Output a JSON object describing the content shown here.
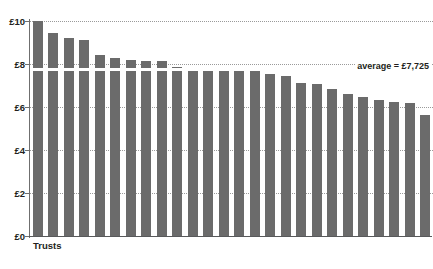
{
  "chart_data": {
    "type": "bar",
    "title": "",
    "xlabel": "Trusts",
    "ylabel": "",
    "ylim": [
      0,
      10
    ],
    "grid": true,
    "legend_position": "none",
    "ytick_labels": [
      "£0",
      "£2",
      "£4",
      "£6",
      "£8",
      "£10"
    ],
    "ytick_values": [
      0,
      2,
      4,
      6,
      8,
      10
    ],
    "bar_color": "#6b6b6b",
    "categories": [
      "T1",
      "T2",
      "T3",
      "T4",
      "T5",
      "T6",
      "T7",
      "T8",
      "T9",
      "T10",
      "T11",
      "T12",
      "T13",
      "T14",
      "T15",
      "T16",
      "T17",
      "T18",
      "T19",
      "T20",
      "T21",
      "T22",
      "T23",
      "T24",
      "T25",
      "T26"
    ],
    "values": [
      9.98,
      9.45,
      9.22,
      9.1,
      8.42,
      8.28,
      8.2,
      8.15,
      8.12,
      7.85,
      7.72,
      7.68,
      7.68,
      7.68,
      7.68,
      7.52,
      7.42,
      7.1,
      7.05,
      6.82,
      6.62,
      6.48,
      6.32,
      6.22,
      6.2,
      5.65
    ],
    "annotations": [
      {
        "name": "average-line",
        "label": "average = £7,725",
        "value": 7.725,
        "color": "#ffffff"
      }
    ]
  },
  "axis": {
    "x_title": "Trusts"
  },
  "average": {
    "label": "average = £7,725"
  }
}
